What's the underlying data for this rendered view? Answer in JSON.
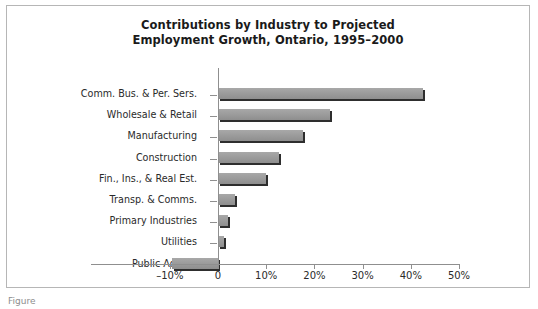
{
  "figure": {
    "caption_fragment": "Figure"
  },
  "chart_data": {
    "type": "bar",
    "orientation": "horizontal",
    "title": "Contributions by Industry to Projected Employment Growth, Ontario, 1995–2000",
    "title_lines": [
      "Contributions by Industry to Projected",
      "Employment Growth, Ontario, 1995–2000"
    ],
    "xlabel": "",
    "ylabel": "",
    "categories": [
      "Comm. Bus. & Per. Sers.",
      "Wholesale & Retail",
      "Manufacturing",
      "Construction",
      "Fin., Ins., & Real Est.",
      "Transp. & Comms.",
      "Primary Industries",
      "Utilities",
      "Public Admin."
    ],
    "values": [
      42.5,
      23.3,
      17.7,
      12.7,
      10.0,
      3.5,
      2.0,
      1.2,
      -9.5
    ],
    "value_unit": "%",
    "xlim": [
      -10,
      50
    ],
    "xticks": [
      -10,
      0,
      10,
      20,
      30,
      40,
      50
    ],
    "xticklabels": [
      "–10%",
      "0",
      "10%",
      "20%",
      "30%",
      "40%",
      "50%"
    ],
    "grid": false,
    "legend": false,
    "bar_color": "#9a9a9a",
    "bar_shadow_color": "#2e2e2e",
    "axis_color": "#8f8f8f"
  }
}
